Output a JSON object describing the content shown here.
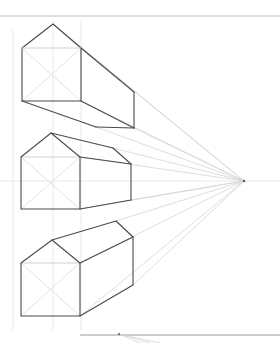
{
  "drawing": {
    "title": "",
    "type": "one-point perspective sketch",
    "colors": {
      "background": "#ffffff",
      "edge": "#4a4a4a",
      "construction": "#d4d4d4",
      "rule": "#bdbdbd"
    },
    "vanishing_point": {
      "x": 244,
      "y": 181
    },
    "top_rule_y": 16,
    "bottom_rule": {
      "y": 335,
      "x1": 80,
      "x2": 280
    },
    "houses": [
      {
        "name": "house-top",
        "front": {
          "x1": 22,
          "y1": 48,
          "x2": 81,
          "y2": 101
        },
        "apex": {
          "x": 53,
          "y": 24
        }
      },
      {
        "name": "house-middle",
        "front": {
          "x1": 21,
          "y1": 157,
          "x2": 80,
          "y2": 209
        },
        "apex": {
          "x": 51,
          "y": 133
        }
      },
      {
        "name": "house-bottom",
        "front": {
          "x1": 21,
          "y1": 263,
          "x2": 80,
          "y2": 316
        },
        "apex": {
          "x": 52,
          "y": 240
        }
      }
    ]
  }
}
